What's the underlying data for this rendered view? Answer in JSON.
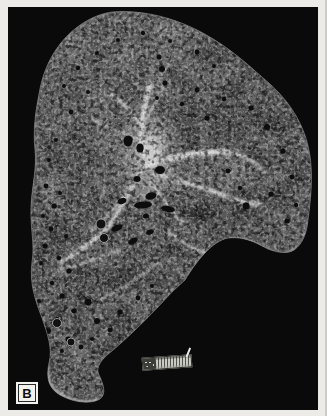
{
  "figure": {
    "panel_label": "B",
    "photo": {
      "background_color": "#0a0a0a",
      "border_color": "#ecebe7",
      "specimen_base_color": "#757575",
      "specimen_highlight_color": "#d6d6d6",
      "specimen_hole_color": "#0d0d0d"
    },
    "scale_ruler": {
      "body_color": "#c9c9c3",
      "dark_end_color": "#3c3c38"
    }
  }
}
